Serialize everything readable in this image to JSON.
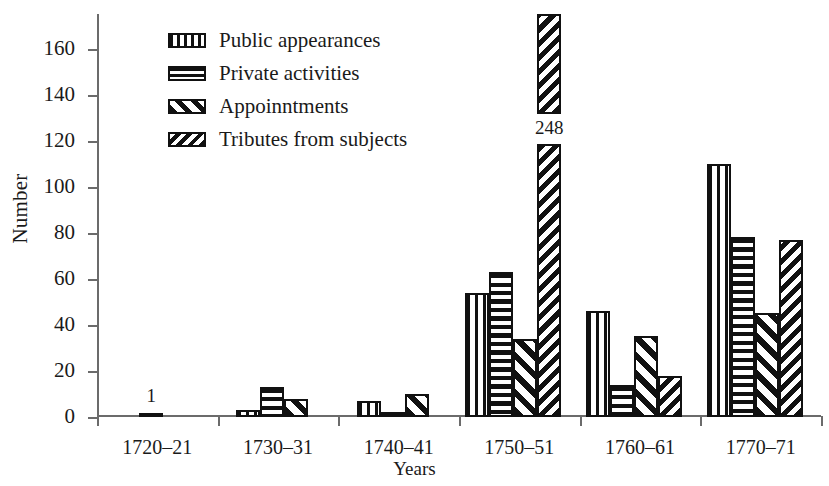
{
  "chart_data": {
    "type": "bar",
    "title": "",
    "xlabel": "Years",
    "ylabel": "Number",
    "ylim": [
      0,
      175
    ],
    "yticks": [
      0,
      20,
      40,
      60,
      80,
      100,
      120,
      140,
      160
    ],
    "grid": false,
    "legend_position": "upper-left-inside",
    "categories": [
      "1720–21",
      "1730–31",
      "1740–41",
      "1750–51",
      "1760–61",
      "1770–71"
    ],
    "series": [
      {
        "name": "Public appearances",
        "pattern": "vertical",
        "values": [
          1,
          3,
          7,
          54,
          46,
          110
        ]
      },
      {
        "name": "Private activities",
        "pattern": "horizontal",
        "values": [
          0,
          13,
          2,
          63,
          14,
          78
        ]
      },
      {
        "name": "Appoinntments",
        "pattern": "diagonal",
        "values": [
          0,
          8,
          10,
          34,
          35,
          45
        ]
      },
      {
        "name": "Tributes from subjects",
        "pattern": "dense-diagonal",
        "values": [
          0,
          0,
          0,
          248,
          18,
          77
        ]
      }
    ],
    "annotations": [
      {
        "text": "1",
        "category": "1720–21",
        "series": "Public appearances",
        "value": 1
      },
      {
        "text": "248",
        "category": "1750–51",
        "series": "Tributes from subjects",
        "value": 248,
        "note": "bar truncated / axis break"
      }
    ]
  },
  "legend": {
    "items": [
      {
        "label": "Public appearances",
        "pattern": "vertical"
      },
      {
        "label": "Private activities",
        "pattern": "horizontal"
      },
      {
        "label": "Appoinntments",
        "pattern": "diagonal"
      },
      {
        "label": "Tributes from subjects",
        "pattern": "dense-diagonal"
      }
    ]
  },
  "colors": {
    "ink": "#111111",
    "axis": "#6b6b6b",
    "background": "#ffffff"
  }
}
